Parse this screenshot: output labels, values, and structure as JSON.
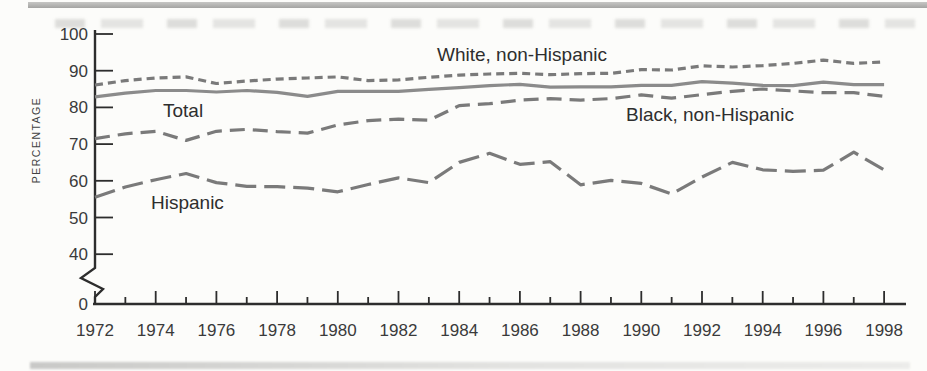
{
  "page": {
    "background_color": "#fcfcfa",
    "artifact_note": "scanned page with gray bands at top and bottom"
  },
  "chart_data": {
    "type": "line",
    "title": "",
    "xlabel": "",
    "ylabel": "PERCENTAGE",
    "x_range": [
      1972,
      1998
    ],
    "ylim": [
      40,
      100
    ],
    "y_axis_break": true,
    "grid": false,
    "legend_position": "inline-annotations",
    "x": [
      1972,
      1973,
      1974,
      1975,
      1976,
      1977,
      1978,
      1979,
      1980,
      1981,
      1982,
      1983,
      1984,
      1985,
      1986,
      1987,
      1988,
      1989,
      1990,
      1991,
      1992,
      1993,
      1994,
      1995,
      1996,
      1997,
      1998
    ],
    "x_tick_labels": [
      "1972",
      "1974",
      "1976",
      "1978",
      "1980",
      "1982",
      "1984",
      "1986",
      "1988",
      "1990",
      "1992",
      "1994",
      "1996",
      "1998"
    ],
    "y_tick_values": [
      100,
      90,
      80,
      70,
      60,
      50,
      40
    ],
    "y_tick_labels": [
      "100",
      "90",
      "80",
      "70",
      "60",
      "50",
      "40"
    ],
    "y_origin_label": "0",
    "axis_color": "#2d2d2d",
    "dash_line_color": "#7a7a7a",
    "solid_line_color": "#8b8b8b",
    "series": [
      {
        "name": "White, non-Hispanic",
        "style": "short-dash",
        "values": [
          86.1,
          87.3,
          88.0,
          88.3,
          86.5,
          87.2,
          87.7,
          88.0,
          88.3,
          87.3,
          87.5,
          88.2,
          88.8,
          89.1,
          89.3,
          88.9,
          89.2,
          89.3,
          90.3,
          90.2,
          91.3,
          91.0,
          91.4,
          92.0,
          92.9,
          92.0,
          92.4
        ]
      },
      {
        "name": "Total",
        "style": "solid",
        "values": [
          82.9,
          83.9,
          84.6,
          84.6,
          84.2,
          84.6,
          84.1,
          83.0,
          84.4,
          84.4,
          84.4,
          84.9,
          85.4,
          85.9,
          86.3,
          85.5,
          85.6,
          85.6,
          86.0,
          86.0,
          87.0,
          86.6,
          86.0,
          85.9,
          86.9,
          86.2,
          86.2
        ]
      },
      {
        "name": "Black, non-Hispanic",
        "style": "medium-dash",
        "values": [
          71.5,
          72.8,
          73.5,
          71.0,
          73.5,
          74.0,
          73.4,
          73.0,
          75.2,
          76.4,
          76.8,
          76.5,
          80.5,
          81.0,
          82.0,
          82.4,
          82.0,
          82.4,
          83.4,
          82.5,
          83.5,
          84.4,
          85.0,
          84.5,
          84.0,
          84.0,
          83.0
        ]
      },
      {
        "name": "Hispanic",
        "style": "long-dash",
        "values": [
          55.5,
          58.3,
          60.3,
          62.0,
          59.5,
          58.5,
          58.4,
          58.0,
          57.0,
          59.0,
          60.8,
          59.5,
          65.0,
          67.5,
          64.5,
          65.2,
          58.9,
          60.1,
          59.3,
          56.4,
          61.0,
          65.0,
          63.0,
          62.6,
          62.9,
          67.8,
          63.0
        ]
      }
    ]
  }
}
